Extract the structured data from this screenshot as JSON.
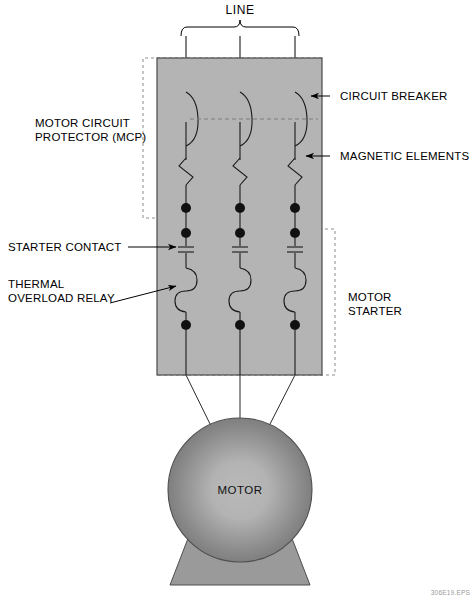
{
  "figure": {
    "title_top": "LINE",
    "credit": "306E19.EPS",
    "motor_label": "MOTOR"
  },
  "labels": {
    "line": "LINE",
    "circuit_breaker": "CIRCUIT BREAKER",
    "magnetic_elements": "MAGNETIC ELEMENTS",
    "mcp_line1": "MOTOR CIRCUIT",
    "mcp_line2": "PROTECTOR (MCP)",
    "starter_contact": "STARTER CONTACT",
    "thermal_line1": "THERMAL",
    "thermal_line2": "OVERLOAD RELAY",
    "motor_starter_line1": "MOTOR",
    "motor_starter_line2": "STARTER",
    "motor": "MOTOR"
  },
  "colors": {
    "enclosure_fill": "#b4b4b4",
    "enclosure_stroke": "#4a4a4a",
    "wire": "#1a1a1a",
    "dashed_box": "#8c8c8c",
    "motor_outer": "#808080",
    "motor_inner": "#b9b9b9",
    "text": "#000000",
    "credit_text": "#9a9a9a",
    "background": "#ffffff"
  },
  "phases": [
    {
      "name": "phase-1",
      "x": 186
    },
    {
      "name": "phase-2",
      "x": 240
    },
    {
      "name": "phase-3",
      "x": 295
    }
  ],
  "geometry": {
    "enclosure": {
      "x": 157,
      "y": 58,
      "width": 165,
      "height": 317
    },
    "mcp_dashed_box": {
      "x": 143,
      "y": 58,
      "width": 179,
      "height": 160
    },
    "starter_dashed_box": {
      "x": 157,
      "y": 229,
      "width": 178,
      "height": 146
    },
    "motor_circle": {
      "cx": 240,
      "cy": 490,
      "r": 72
    },
    "motor_base": {
      "top_y": 530,
      "bottom_y": 585,
      "top_half_width": 48,
      "bottom_half_width": 70
    },
    "line_bracket": {
      "left": 180,
      "right": 300,
      "y": 26
    },
    "terminal_dot_radius": 5
  },
  "symbols": {
    "circuit_breaker": "breaker-arc",
    "magnetic_element": "zigzag",
    "starter_contact": "parallel-plates",
    "thermal_overload_relay": "s-curve",
    "terminal": "filled-dot",
    "source_arrow": "down-arrow"
  }
}
